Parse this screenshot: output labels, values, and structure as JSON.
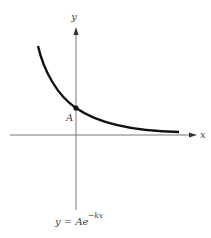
{
  "diagram": {
    "type": "exponential-decay-graph",
    "axes": {
      "x_label": "x",
      "y_label": "y"
    },
    "point_label": "A",
    "equation": {
      "lhs": "y = Ae",
      "exponent": "−kx"
    },
    "colors": {
      "curve": "#111111",
      "axis": "#666666",
      "text": "#444444"
    }
  }
}
